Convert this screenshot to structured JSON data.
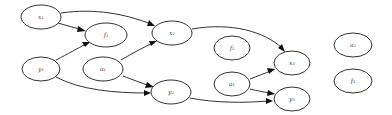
{
  "diagram": {
    "type": "directed-graph",
    "nodes": [
      {
        "id": "x1_top",
        "label": "x₁",
        "cx": 41,
        "cy": 17
      },
      {
        "id": "f1",
        "label": "f₁",
        "cx": 106,
        "cy": 35
      },
      {
        "id": "x2",
        "label": "x₂",
        "cx": 172,
        "cy": 33
      },
      {
        "id": "y1",
        "label": "y₁",
        "cx": 41,
        "cy": 69
      },
      {
        "id": "a1",
        "label": "a₁",
        "cx": 103,
        "cy": 69
      },
      {
        "id": "y2",
        "label": "y₂",
        "cx": 171,
        "cy": 92
      },
      {
        "id": "f2",
        "label": "f₂",
        "cx": 232,
        "cy": 48
      },
      {
        "id": "a1b",
        "label": "a₁",
        "cx": 232,
        "cy": 84
      },
      {
        "id": "x3",
        "label": "x₃",
        "cx": 292,
        "cy": 63
      },
      {
        "id": "y3",
        "label": "y₃",
        "cx": 292,
        "cy": 99
      },
      {
        "id": "a2",
        "label": "a₂",
        "cx": 353,
        "cy": 45
      },
      {
        "id": "f3",
        "label": "f₃",
        "cx": 353,
        "cy": 81
      }
    ],
    "edges": [
      {
        "from": "x1_top",
        "to": "f1"
      },
      {
        "from": "x1_top",
        "to": "x2"
      },
      {
        "from": "y1",
        "to": "f1"
      },
      {
        "from": "y1",
        "to": "y2"
      },
      {
        "from": "a1",
        "to": "x2"
      },
      {
        "from": "a1",
        "to": "y2"
      },
      {
        "from": "x2",
        "to": "x3"
      },
      {
        "from": "y2",
        "to": "y3"
      },
      {
        "from": "a1b",
        "to": "x3"
      },
      {
        "from": "a1b",
        "to": "y3"
      }
    ]
  }
}
